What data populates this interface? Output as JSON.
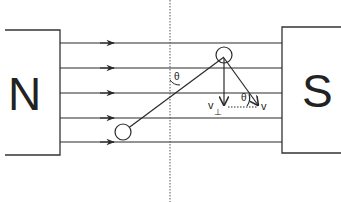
{
  "diagram": {
    "magnets": {
      "north": {
        "label": "N"
      },
      "south": {
        "label": "S"
      }
    },
    "field_lines": {
      "count": 5,
      "direction": "N to S"
    },
    "angle_labels": {
      "rod_angle": "θ",
      "velocity_angle": "θ"
    },
    "vectors": {
      "perpendicular": {
        "label": "v",
        "subscript": "⊥"
      },
      "velocity": {
        "label": "v"
      }
    },
    "colors": {
      "ink": "#2a2a2a",
      "background": "#ffffff"
    }
  }
}
